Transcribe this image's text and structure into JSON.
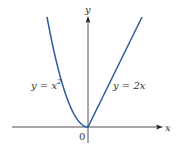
{
  "diagram": {
    "axes": {
      "x_label": "x",
      "y_label": "y",
      "origin_label": "0"
    },
    "curve_color": "#2a5b9a",
    "axis_color": "#222222",
    "curves": [
      {
        "name": "parabola",
        "equation_prefix": "y = x",
        "exponent": "2"
      },
      {
        "name": "line",
        "equation": "y = 2x"
      }
    ]
  }
}
